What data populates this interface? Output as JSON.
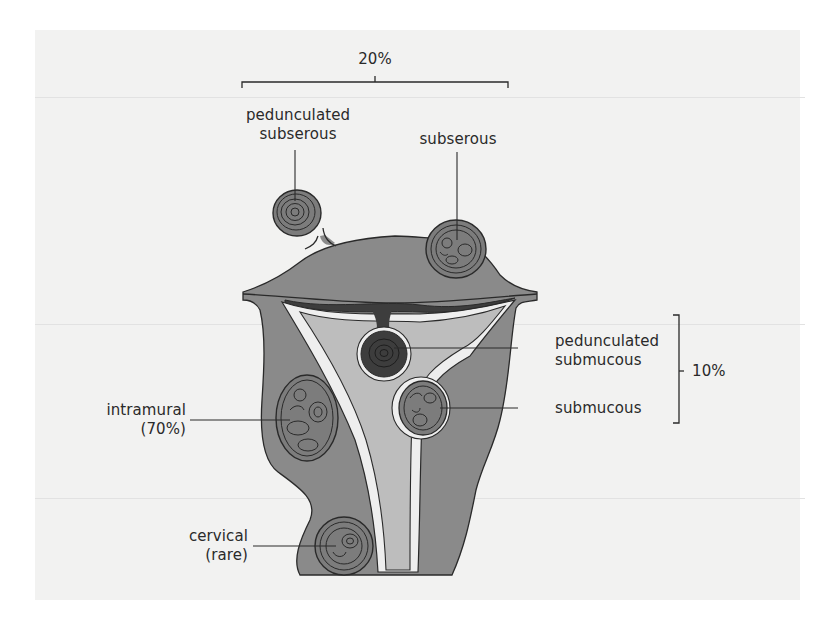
{
  "figure": {
    "colors": {
      "page_background": "#f2f2f1",
      "myometrium": "#8a8a8a",
      "fibroid": "#7c7c7c",
      "endometrium": "#bdbdbd",
      "cavity_lining": "#eeeeee",
      "pedunculated_submucous": "#3d3d3d",
      "outline": "#2a2a2a",
      "text": "#2a2a2a"
    },
    "brackets": {
      "subserous_group": {
        "label": "20%"
      },
      "submucous_group": {
        "label": "10%"
      }
    },
    "labels": {
      "pedunculated_subserous": {
        "line1": "pedunculated",
        "line2": "subserous"
      },
      "subserous": {
        "line1": "subserous"
      },
      "pedunculated_submucous": {
        "line1": "pedunculated",
        "line2": "submucous"
      },
      "submucous": {
        "line1": "submucous"
      },
      "intramural": {
        "line1": "intramural",
        "line2": "(70%)"
      },
      "cervical": {
        "line1": "cervical",
        "line2": "(rare)"
      }
    }
  }
}
